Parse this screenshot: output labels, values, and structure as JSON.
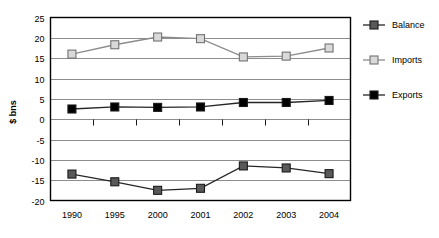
{
  "chart_data": {
    "type": "line",
    "title": "",
    "subtitle": "",
    "xlabel": "",
    "ylabel": "$ bns",
    "categories": [
      "1990",
      "1995",
      "2000",
      "2001",
      "2002",
      "2003",
      "2004"
    ],
    "ylim": [
      -20,
      25
    ],
    "ytick_step": 5,
    "yticks": [
      "25",
      "20",
      "15",
      "10",
      "5",
      "0",
      "-5",
      "-10",
      "-15",
      "-20"
    ],
    "grid": "horizontal",
    "legend_position": "right",
    "series": [
      {
        "name": "Balance",
        "color": "#595959",
        "marker": "square-filled",
        "values": [
          -13.5,
          -15.4,
          -17.5,
          -17.0,
          -11.5,
          -12.0,
          -13.4
        ]
      },
      {
        "name": "Imports",
        "color": "#d9d9d9",
        "marker": "square-open",
        "values": [
          16.0,
          18.3,
          20.2,
          19.8,
          15.3,
          15.5,
          17.5
        ]
      },
      {
        "name": "Exports",
        "color": "#000000",
        "marker": "square-filled",
        "values": [
          2.5,
          3.0,
          2.9,
          3.0,
          4.1,
          4.1,
          4.6
        ]
      }
    ],
    "colors": {
      "balance": "#595959",
      "imports": "#d9d9d9",
      "exports": "#000000",
      "gridline": "#808080",
      "axis": "#000000",
      "background": "#ffffff",
      "marker_edge": "#404040"
    }
  }
}
